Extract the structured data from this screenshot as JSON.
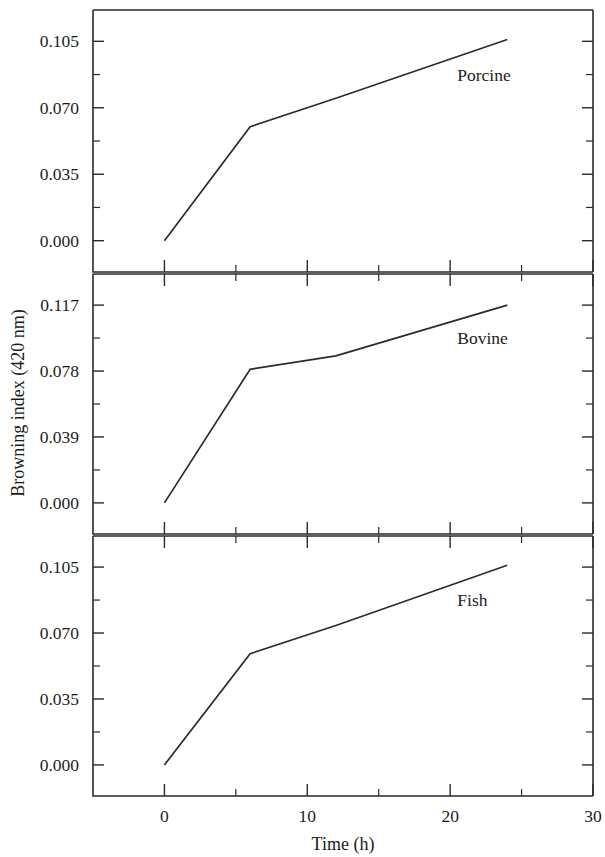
{
  "chart_data": {
    "type": "line",
    "title": "",
    "xlabel": "Time (h)",
    "ylabel": "Browning index (420 nm)",
    "xlim": [
      -5,
      30
    ],
    "x_ticks_major": [
      0,
      10,
      20,
      30
    ],
    "x_ticks_major_labels": [
      "0",
      "10",
      "20",
      "30"
    ],
    "x_ticks_minor": [
      5,
      15,
      25
    ],
    "grid": false,
    "legend": "none",
    "panels": [
      {
        "name": "Porcine",
        "label": "Porcine",
        "ylim": [
          -0.0165,
          0.1215
        ],
        "y_ticks": [
          0.0,
          0.035,
          0.07,
          0.105
        ],
        "y_tick_labels": [
          "0.000",
          "0.035",
          "0.070",
          "0.105"
        ],
        "y_minor_ticks": [
          0.0175,
          0.0525,
          0.0875
        ],
        "x": [
          0,
          6,
          12,
          24
        ],
        "values": [
          0.0,
          0.06,
          0.075,
          0.106
        ]
      },
      {
        "name": "Bovine",
        "label": "Bovine",
        "ylim": [
          -0.0184,
          0.1354
        ],
        "y_ticks": [
          0.0,
          0.039,
          0.078,
          0.117
        ],
        "y_tick_labels": [
          "0.000",
          "0.039",
          "0.078",
          "0.117"
        ],
        "y_minor_ticks": [
          0.0195,
          0.0585,
          0.0975
        ],
        "x": [
          0,
          6,
          12,
          24
        ],
        "values": [
          0.0,
          0.079,
          0.087,
          0.117
        ]
      },
      {
        "name": "Fish",
        "label": "Fish",
        "ylim": [
          -0.0165,
          0.1215
        ],
        "y_ticks": [
          0.0,
          0.035,
          0.07,
          0.105
        ],
        "y_tick_labels": [
          "0.000",
          "0.035",
          "0.070",
          "0.105"
        ],
        "y_minor_ticks": [
          0.0175,
          0.0525,
          0.0875
        ],
        "x": [
          0,
          6,
          12,
          24
        ],
        "values": [
          0.0,
          0.059,
          0.074,
          0.106
        ]
      }
    ]
  },
  "figure": {
    "axis_color": "#2a2a2a",
    "line_color": "#2b2b2b",
    "background": "#ffffff"
  }
}
